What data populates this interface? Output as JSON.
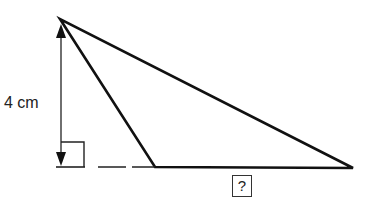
{
  "diagram": {
    "height_label": "4 cm",
    "unknown_label": "?",
    "shape": "obtuse triangle with perpendicular height",
    "colors": {
      "line": "#111111",
      "background": "#ffffff"
    }
  }
}
